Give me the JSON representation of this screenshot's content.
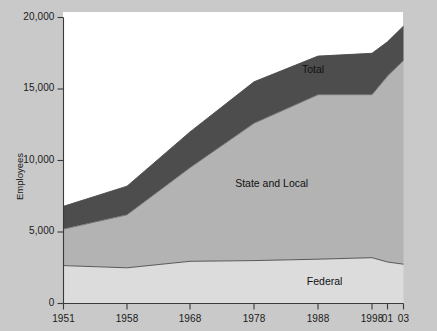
{
  "chart_data": {
    "type": "area",
    "stacked": true,
    "title": "",
    "subtitle": "",
    "xlabel": "",
    "ylabel": "Employees",
    "x": [
      1951,
      1958,
      1968,
      1978,
      1988,
      1998,
      2001,
      2003
    ],
    "xtick_labels": [
      "1951",
      "1958",
      "1968",
      "1978",
      "1988",
      "1998",
      "01",
      "03"
    ],
    "ytick_labels": [
      "0",
      "5,000",
      "10,000",
      "15,000",
      "20,000"
    ],
    "ytick_values": [
      0,
      5000,
      10000,
      15000,
      20000
    ],
    "ylim": [
      0,
      20000
    ],
    "xlim": [
      1951,
      2003
    ],
    "grid": false,
    "legend": "inline-labels",
    "series": [
      {
        "name": "Federal",
        "label": "Federal",
        "color": "#dcdcdc",
        "values": [
          2650,
          2500,
          2950,
          3000,
          3100,
          3200,
          2900,
          2750
        ]
      },
      {
        "name": "State and Local",
        "label": "State and Local",
        "color": "#b3b3b3",
        "cumulative_values": [
          5200,
          6200,
          9500,
          12600,
          14600,
          14600,
          15900,
          17000
        ],
        "values": [
          2550,
          3700,
          6550,
          9600,
          11500,
          11400,
          13000,
          14250
        ]
      },
      {
        "name": "Total",
        "label": "Total",
        "color": "#4d4d4d",
        "cumulative_values": [
          6800,
          8200,
          12000,
          15500,
          17300,
          17500,
          18300,
          19400
        ],
        "values": [
          1600,
          2000,
          2500,
          2900,
          2700,
          2900,
          2400,
          2400
        ]
      }
    ],
    "annotations": [
      {
        "text": "Total",
        "x": 1988,
        "y": 16400
      },
      {
        "text": "State and Local",
        "x": 1981,
        "y": 8400
      },
      {
        "text": "Federal",
        "x": 1990,
        "y": 1600
      }
    ]
  },
  "colors": {
    "total_band": "#4d4d4d",
    "state_band": "#b3b3b3",
    "federal_band": "#dcdcdc",
    "axis": "#3a3a3a",
    "plot_background": "#ffffff",
    "page_background": "#c9c9c9",
    "text": "#1a1a1a"
  }
}
